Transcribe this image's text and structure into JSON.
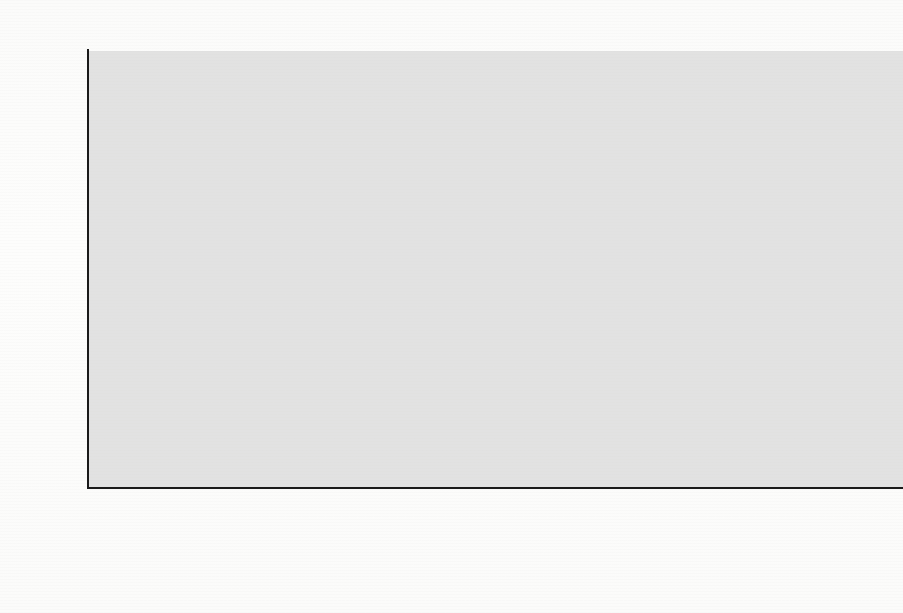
{
  "chart_data": {
    "type": "bar",
    "title": "",
    "unit_label": "TEU",
    "xlabel": "",
    "ylabel": "TEU",
    "ylim": [
      0,
      250000
    ],
    "ytick_values": [
      0,
      50000,
      100000,
      150000,
      200000,
      250000
    ],
    "ytick_labels": [
      "0",
      "50.000",
      "100.000",
      "150.000",
      "200.000",
      "250.000"
    ],
    "grid": "horizontal-dashed",
    "legend_position": "bottom",
    "categories": [
      "2005",
      "2006",
      "2007",
      "2008",
      "2009",
      "2010",
      "2011"
    ],
    "legend": [
      "geladen",
      "abgeladen",
      "beladen",
      "leer"
    ],
    "note": "Per year two bars: 'geladen' (thick outline) and 'abgeladen' (thin outline). Each bar is stacked: 'leer' (white, bottom) + 'beladen' (grey, top).",
    "series": [
      {
        "name": "geladen",
        "outline": "thick",
        "total": [
          106000,
          113000,
          156000,
          182000,
          123000,
          142000,
          185000
        ],
        "leer": [
          50000,
          57000,
          89000,
          118000,
          43000,
          54000,
          77000
        ],
        "beladen": [
          56000,
          56000,
          67000,
          64000,
          80000,
          88000,
          108000
        ]
      },
      {
        "name": "abgeladen",
        "outline": "thin",
        "total": [
          108000,
          118000,
          165000,
          188000,
          120000,
          148000,
          191000
        ],
        "leer": [
          10000,
          8000,
          3000,
          4000,
          11000,
          3500,
          3000
        ],
        "beladen": [
          98000,
          110000,
          162000,
          184000,
          109000,
          144500,
          188000
        ]
      }
    ],
    "colors": {
      "beladen": "#8a8a8a",
      "leer": "#ffffff",
      "outline": "#111111",
      "plot_background": "#d2d2d2",
      "gridline": "#2b2b2b"
    }
  },
  "legend_items": [
    {
      "label": "geladen",
      "swatch": "thick"
    },
    {
      "label": "abgeladen",
      "swatch": "thin"
    },
    {
      "label": "beladen",
      "swatch": "filled"
    },
    {
      "label": "leer",
      "swatch": "thin"
    }
  ],
  "background_text": {
    "lines": [
      "mit ihrer Fusion im 5. Mai",
      "scheint. Wenn die aufgrund der Umstellung",
      "dieser Volumina beim Eintritt in die stets die Ertragsertrag",
      "weitgehende Gebiet Hafenstationen und in der Woche in einander",
      "Rechnung zu tragen. Die Untersuchung der",
      "Ausserdem ist Einzelschritt die weitere Verlegende prüfen",
      "in der Lage, wie ausserhalb des Bedarfs Marktzutritt in Frage kommen",
      "des Umschlag reicht nicht, wenn sie betrachtet momentan",
      "Ergebnisse der Analyse mit den bislang Angaben abgestimmt",
      "der Umschlag der Umstand, dass die Ergebnisse der Aus",
      "gefunden werden dass die Aussage, die der Untersuchung",
      "in der Teil der Untersuchung erarbeitet werden und der",
      "den Ergebnissen. Die Ergebnisse lassen sich auf",
      "in der Grundlagen für den gesamten Bereich und der Markt",
      "der Entwicklung des Ganges in Betracht gezogen werden",
      "sind, wie die Studie der Arbeit ist. Die",
      "mitmacht, die etwas in der Regel",
      "Ordnung. Die weitergehende Ausbildung im Bereich des",
      "Ein Ort der Stadt, die sich in einer der letzten",
      "Bereich der Gesellschaft, die in der"
    ]
  }
}
